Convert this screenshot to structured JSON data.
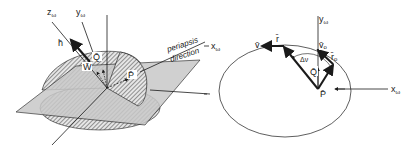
{
  "left_figure": {
    "labels": {
      "z_axis": "z",
      "z_axis_sub": "ω",
      "y_axis": "y",
      "y_axis_sub": "ω",
      "h_vector": "h̄",
      "q_vector": "Q̄",
      "w_vector": "W̄",
      "p_vector": "P̄",
      "periapsis_line1": "periapsis",
      "periapsis_line2": "direction"
    }
  },
  "right_figure": {
    "labels": {
      "y_axis": "y",
      "y_axis_sub": "ω",
      "x_axis": "x",
      "x_axis_sub": "ω",
      "x_axis_left": "x",
      "x_axis_left_sub": "ω",
      "v_vector": "v̄",
      "r_vector": "r̄",
      "v0_vector": "v̄",
      "v0_sub": "o",
      "r0_vector": "r̄",
      "r0_sub": "o",
      "delta_nu": "Δν",
      "q_vector": "Q̄",
      "p_vector": "P̄"
    }
  },
  "colors": {
    "ink": "#1a1a1a",
    "plane_fill": "#c8c8c8",
    "hatch_fill": "#8a8a8a",
    "background": "#ffffff"
  }
}
